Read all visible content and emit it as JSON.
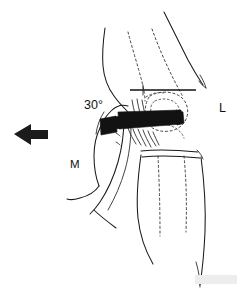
{
  "figure": {
    "background_color": "#ffffff",
    "ink_color": "#1a1a1a",
    "width": 244,
    "height": 292
  },
  "annotations": {
    "flexion_angle": {
      "text": "30°",
      "name": "flexion-angle-label",
      "x": 84,
      "y": 109
    },
    "lateral": {
      "text": "L",
      "name": "lateral-side-label",
      "x": 219,
      "y": 112
    },
    "medial": {
      "text": "M",
      "name": "medial-side-label",
      "x": 70,
      "y": 168
    }
  },
  "force_arrow": {
    "name": "medial-force-arrow",
    "direction": "left",
    "color": "#1b1b1b",
    "tail_x": 48,
    "head_x": 14,
    "center_y": 134
  },
  "device": {
    "name": "handheld-device",
    "color": "#121212",
    "body": {
      "x": 118,
      "y": 111,
      "width": 64,
      "height": 17
    },
    "tab": {
      "x": 99,
      "y": 118,
      "width": 18,
      "height": 16
    }
  },
  "reference_line": {
    "name": "horizontal-reference-line",
    "x1": 130,
    "x2": 196,
    "y": 90
  },
  "structures": [
    {
      "name": "thigh-anterior-outline",
      "style": "solid"
    },
    {
      "name": "thigh-posterior-outline",
      "style": "solid"
    },
    {
      "name": "patella-outline",
      "style": "dashed"
    },
    {
      "name": "femoral-condyle-outline",
      "style": "dashed"
    },
    {
      "name": "quadriceps-tendon-line",
      "style": "dashed"
    },
    {
      "name": "iliotibial-band-line",
      "style": "dashed"
    },
    {
      "name": "tibial-tuberosity-line",
      "style": "dashed"
    },
    {
      "name": "fibula-line",
      "style": "dashed"
    },
    {
      "name": "joint-line-crease",
      "style": "solid"
    },
    {
      "name": "lower-leg-anterior-outline",
      "style": "solid"
    },
    {
      "name": "lower-leg-posterior-outline",
      "style": "solid"
    },
    {
      "name": "hand-thumb-outline",
      "style": "solid"
    },
    {
      "name": "hand-index-finger-outline",
      "style": "solid"
    },
    {
      "name": "hand-dorsum-outline",
      "style": "solid"
    },
    {
      "name": "finger-crease-lines",
      "style": "solid"
    }
  ]
}
